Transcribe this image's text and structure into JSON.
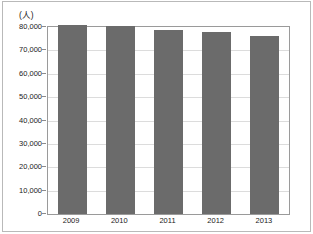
{
  "chart_data": {
    "type": "bar",
    "title": "",
    "subtitle": "",
    "xlabel": "",
    "ylabel": "",
    "unit_label": "(人)",
    "categories": [
      "2009",
      "2010",
      "2011",
      "2012",
      "2013"
    ],
    "values": [
      81000,
      80500,
      78800,
      77700,
      76300
    ],
    "series": [
      {
        "name": "",
        "values": [
          81000,
          80500,
          78800,
          77700,
          76300
        ]
      }
    ],
    "ylim": [
      0,
      80000
    ],
    "ytick_values": [
      0,
      10000,
      20000,
      30000,
      40000,
      50000,
      60000,
      70000,
      80000
    ],
    "ytick_labels": [
      "0",
      "10,000",
      "20,000",
      "30,000",
      "40,000",
      "50,000",
      "60,000",
      "70,000",
      "80,000"
    ],
    "grid": true,
    "grid_axis": "y",
    "legend": false,
    "legend_position": "none",
    "bar_color": "#6b6b6b",
    "gridline_color": "#dcdcdc",
    "plot_border_color": "#9a9a9a",
    "frame_color": "#b9b9b9",
    "background_color": "#ffffff",
    "text_color": "#1a1a1a"
  }
}
